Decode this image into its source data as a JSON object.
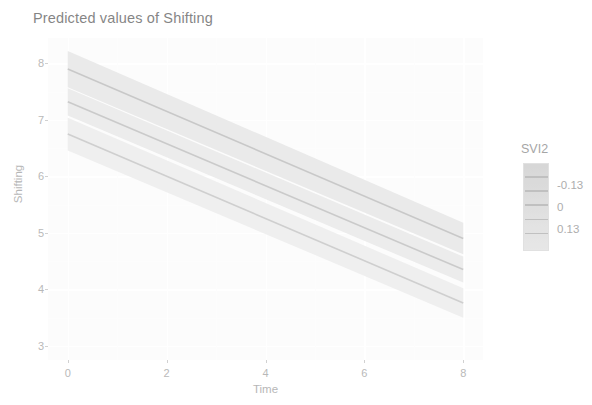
{
  "chart_data": {
    "type": "line",
    "title": "Predicted values of Shifting",
    "xlabel": "Time",
    "ylabel": "Shifting",
    "xlim": [
      -0.4,
      8.4
    ],
    "ylim": [
      2.75,
      8.45
    ],
    "xticks": [
      0,
      2,
      4,
      6,
      8
    ],
    "xticklabels": [
      "0",
      "2",
      "4",
      "6",
      "8"
    ],
    "yticks": [
      3,
      4,
      5,
      6,
      7,
      8
    ],
    "yticklabels": [
      "3",
      "4",
      "5",
      "6",
      "7",
      "8"
    ],
    "grid": true,
    "grid_color": "#ffffff",
    "panel_background": "#fbfbfb",
    "legend": {
      "title": "SVI2",
      "position": "right",
      "type": "colorbar",
      "labels": [
        "-0.13",
        "0",
        "0.13"
      ],
      "values": [
        -0.13,
        0,
        0.13
      ],
      "break_values": [
        -0.13,
        0,
        0.13
      ],
      "colors": [
        "#bfbfbf",
        "#cccccc",
        "#d9d9d9"
      ]
    },
    "x": [
      0,
      8
    ],
    "series": [
      {
        "name": "-0.13",
        "legend_value": -0.13,
        "values": [
          7.9,
          4.9
        ],
        "ribbon_low": [
          7.58,
          4.62
        ],
        "ribbon_high": [
          8.22,
          5.18
        ],
        "color": "#a8a8a8",
        "ribbon_color": "#d8d8d8"
      },
      {
        "name": "0",
        "legend_value": 0,
        "values": [
          7.32,
          4.35
        ],
        "ribbon_low": [
          7.08,
          4.12
        ],
        "ribbon_high": [
          7.56,
          4.58
        ],
        "color": "#ababab",
        "ribbon_color": "#dcdcdc"
      },
      {
        "name": "0.13",
        "legend_value": 0.13,
        "values": [
          6.75,
          3.76
        ],
        "ribbon_low": [
          6.46,
          3.5
        ],
        "ribbon_high": [
          7.04,
          4.02
        ],
        "color": "#b2b2b2",
        "ribbon_color": "#e2e2e2"
      }
    ],
    "annotations": []
  },
  "axes": {
    "y_title": "Shifting",
    "x_title": "Time",
    "y_tick_labels": [
      "8",
      "7",
      "6",
      "5",
      "4",
      "3"
    ],
    "x_tick_labels": [
      "0",
      "2",
      "4",
      "6",
      "8"
    ]
  },
  "legend_panel": {
    "title": "SVI2",
    "labels": [
      "-0.13",
      "0",
      "0.13"
    ]
  },
  "title": {
    "text": "Predicted values of Shifting"
  }
}
